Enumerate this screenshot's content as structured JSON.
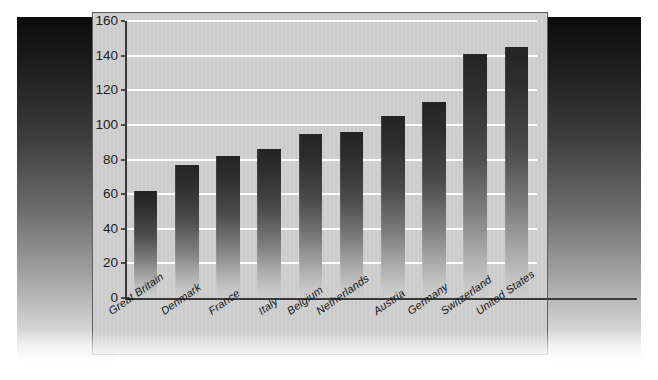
{
  "chart_data": {
    "type": "bar",
    "title": "",
    "subtitle": "",
    "xlabel": "",
    "ylabel": "",
    "categories": [
      "Great Britain",
      "Denmark",
      "France",
      "Italy",
      "Belgium",
      "Netherlands",
      "Austria",
      "Germany",
      "Switzerland",
      "United States"
    ],
    "values": [
      62,
      77,
      82,
      86,
      95,
      96,
      105,
      113,
      141,
      145
    ],
    "ylim": [
      0,
      160
    ],
    "ytick_step": 20,
    "yticks": [
      0,
      20,
      40,
      60,
      80,
      100,
      120,
      140,
      160
    ],
    "ytick_labels": [
      "0",
      "20",
      "40",
      "60",
      "80",
      "100",
      "120",
      "140",
      "160"
    ],
    "grid": "horizontal",
    "gridline_color": "#ffffff",
    "legend": "none",
    "annotations": [],
    "series": [
      {
        "name": "",
        "values": [
          62,
          77,
          82,
          86,
          95,
          96,
          105,
          113,
          141,
          145
        ]
      }
    ]
  },
  "style": {
    "plot_background": "#cfcfcf",
    "bar_top_color": "#242424",
    "bar_bottom_color": "#cccccc",
    "axis_color": "#3a3a3a",
    "panel_border": "#5c5c5c",
    "page_background": "#ffffff"
  }
}
